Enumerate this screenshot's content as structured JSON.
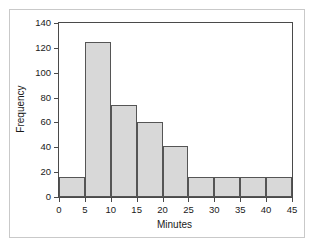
{
  "chart_data": {
    "type": "bar",
    "title": "",
    "xlabel": "Minutes",
    "ylabel": "Frequency",
    "xlim": [
      0,
      45
    ],
    "ylim": [
      0,
      140
    ],
    "grid": false,
    "legend": null,
    "bin_width": 5,
    "bin_edges": [
      0,
      5,
      10,
      15,
      20,
      25,
      30,
      35,
      40,
      45
    ],
    "categories": [
      "0-5",
      "5-10",
      "10-15",
      "15-20",
      "20-25",
      "25-30",
      "30-35",
      "35-40",
      "40-45"
    ],
    "values": [
      16,
      125,
      74,
      60,
      41,
      16,
      16,
      16,
      16
    ],
    "xticks": [
      0,
      5,
      10,
      15,
      20,
      25,
      30,
      35,
      40,
      45
    ],
    "xtick_labels": [
      "0",
      "5",
      "10",
      "15",
      "20",
      "25",
      "30",
      "35",
      "40",
      "45"
    ],
    "yticks": [
      0,
      20,
      40,
      60,
      80,
      100,
      120,
      140
    ],
    "ytick_labels": [
      "0",
      "20",
      "40",
      "60",
      "80",
      "100",
      "120",
      "140"
    ],
    "bar_fill_color": "#d8d8d8",
    "bar_edge_color": "#555555",
    "axis_color": "#4a4a4a",
    "frame_border_color": "#c9c9c9",
    "background_color": "#ffffff"
  }
}
